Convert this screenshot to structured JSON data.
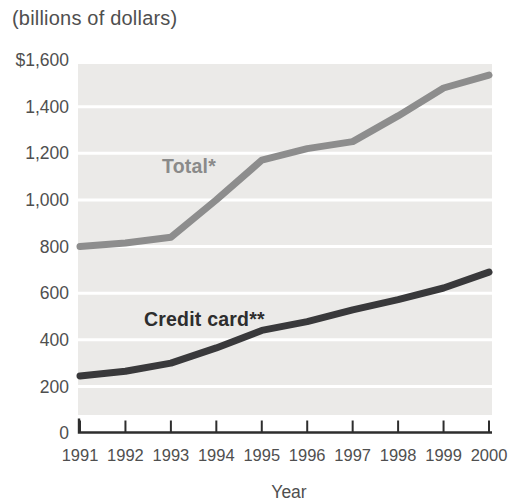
{
  "figure": {
    "title": "(billions of dollars)",
    "x_axis_title": "Year"
  },
  "colors": {
    "plot_background": "#ebeae8",
    "gridline": "#ffffff",
    "axis": "#2e2e2e",
    "tick_label_text": "#4f4f4f",
    "total_line": "#8d8d8d",
    "total_label": "#8a8a8a",
    "credit_card_line": "#39393b",
    "credit_card_label": "#2d2d2d"
  },
  "chart_data": {
    "type": "line",
    "title": "(billions of dollars)",
    "xlabel": "Year",
    "ylabel": "",
    "x_labels": [
      "1991",
      "1992",
      "1993",
      "1994",
      "1995",
      "1996",
      "1997",
      "1998",
      "1999",
      "2000"
    ],
    "x": [
      1991,
      1992,
      1993,
      1994,
      1995,
      1996,
      1997,
      1998,
      1999,
      2000
    ],
    "ylim": [
      0,
      1600
    ],
    "y_tick_values": [
      0,
      200,
      400,
      600,
      800,
      1000,
      1200,
      1400,
      1600
    ],
    "y_tick_labels": [
      "0",
      "200",
      "400",
      "600",
      "800",
      "1,000",
      "1,200",
      "1,400",
      "$1,600"
    ],
    "grid": "horizontal white gridlines on light gray plot area",
    "legend_position": "inline labels on lines",
    "series": [
      {
        "name": "Total*",
        "color": "#8d8d8d",
        "values": [
          800,
          815,
          840,
          1000,
          1170,
          1220,
          1250,
          1360,
          1480,
          1535
        ]
      },
      {
        "name": "Credit card**",
        "color": "#39393b",
        "values": [
          245,
          265,
          300,
          365,
          440,
          478,
          528,
          572,
          622,
          690
        ]
      }
    ]
  }
}
